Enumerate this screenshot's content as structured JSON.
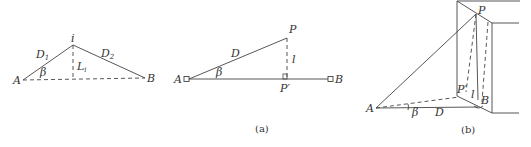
{
  "figure_left": {
    "points": {
      "A": "A",
      "i": "i",
      "B": "B"
    },
    "labels": {
      "D1": "D",
      "D1_sub": "1",
      "D2": "D",
      "D2_sub": "2",
      "beta": "β",
      "L": "L",
      "L_sub": "i"
    }
  },
  "figure_a": {
    "points": {
      "A": "A",
      "B": "B",
      "P": "P",
      "P_prime": "P′"
    },
    "labels": {
      "D": "D",
      "beta": "β",
      "l": "l"
    },
    "caption": "(a)"
  },
  "figure_b": {
    "points": {
      "A": "A",
      "B": "B",
      "P": "P",
      "P_prime": "P′"
    },
    "labels": {
      "D": "D",
      "beta": "β",
      "l": "l"
    },
    "caption": "(b)"
  }
}
